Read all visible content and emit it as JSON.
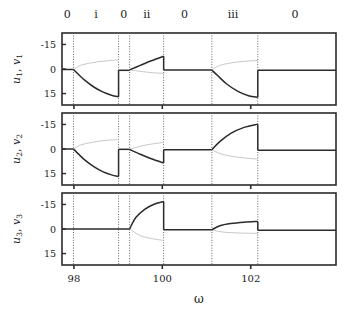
{
  "figure": {
    "xlabel": "ω",
    "x_ticks": [
      98,
      100,
      102
    ],
    "x_tick_labels": [
      "98",
      "100",
      "102"
    ],
    "y_ticks": [
      15,
      0,
      -15
    ],
    "y_tick_labels": [
      "15",
      "0",
      "-15"
    ],
    "xlim": [
      97.73,
      103.93
    ],
    "ylim": [
      -22,
      22
    ],
    "region_labels": [
      "0",
      "i",
      "0",
      "ii",
      "0",
      "iii",
      "0"
    ],
    "region_label_x": [
      97.85,
      98.5,
      99.13,
      99.65,
      100.5,
      101.6,
      103.0
    ],
    "boundaries": [
      97.99,
      99.01,
      99.26,
      100.03,
      101.12,
      102.16
    ],
    "colors": {
      "stable_branch": "#2b2b2b",
      "unstable_branch": "#c8c8c8",
      "axis": "#2b2b2b",
      "boundary_line": "#555555",
      "background": "#ffffff"
    },
    "panels": [
      {
        "ylabel": "u₁, v₁",
        "ylabel_parts": {
          "u": "u",
          "usub": "1",
          "v": "v",
          "vsub": "1"
        }
      },
      {
        "ylabel": "u₂, v₂",
        "ylabel_parts": {
          "u": "u",
          "usub": "2",
          "v": "v",
          "vsub": "2"
        }
      },
      {
        "ylabel": "u₃, v₃",
        "ylabel_parts": {
          "u": "u",
          "usub": "3",
          "v": "v",
          "vsub": "3"
        }
      }
    ]
  },
  "chart_data": {
    "type": "line",
    "title": "",
    "xlabel": "ω",
    "ylabel": "u_i, v_i",
    "xlim": [
      97.73,
      103.93
    ],
    "ylim": [
      -22,
      22
    ],
    "grid": false,
    "legend": null,
    "annotations": [
      {
        "text": "0",
        "x": 97.85,
        "y": 23,
        "note": "region label above top axis"
      },
      {
        "text": "i",
        "x": 98.5,
        "y": 23,
        "note": "region label above top axis"
      },
      {
        "text": "0",
        "x": 99.13,
        "y": 23,
        "note": "region label above top axis"
      },
      {
        "text": "ii",
        "x": 99.65,
        "y": 23,
        "note": "region label above top axis"
      },
      {
        "text": "0",
        "x": 100.5,
        "y": 23,
        "note": "region label above top axis"
      },
      {
        "text": "iii",
        "x": 101.6,
        "y": 23,
        "note": "region label above top axis"
      },
      {
        "text": "0",
        "x": 103.0,
        "y": 23,
        "note": "region label above top axis"
      }
    ],
    "vertical_lines": [
      97.99,
      99.01,
      99.26,
      100.03,
      101.12,
      102.16
    ],
    "panels": [
      {
        "name": "u1_v1",
        "ylabel": "u₁, v₁",
        "yticks": [
          -15,
          0,
          15
        ],
        "series": [
          {
            "name": "u1-trivial-left",
            "style": "stable",
            "x": [
              97.73,
              97.99
            ],
            "y": [
              -0.3,
              -0.3
            ]
          },
          {
            "name": "u1-branch-i-lower",
            "style": "stable",
            "x": [
              97.99,
              98.1,
              98.25,
              98.45,
              98.65,
              98.85,
              99.01
            ],
            "y": [
              -0.3,
              -3.2,
              -7.0,
              -11.0,
              -14.0,
              -16.0,
              -17.0
            ]
          },
          {
            "name": "v1-branch-i-upper",
            "style": "unstable",
            "x": [
              97.99,
              98.15,
              98.4,
              98.7,
              99.01
            ],
            "y": [
              -0.3,
              2.2,
              3.8,
              4.9,
              5.6
            ]
          },
          {
            "name": "u1-branch-0b",
            "style": "stable",
            "x": [
              99.01,
              99.26
            ],
            "y": [
              -0.8,
              -0.8
            ]
          },
          {
            "name": "u1-branch-ii-upper",
            "style": "stable",
            "x": [
              99.26,
              99.5,
              99.75,
              100.03
            ],
            "y": [
              -0.5,
              2.2,
              5.0,
              7.8
            ]
          },
          {
            "name": "v1-branch-ii-lower",
            "style": "unstable",
            "x": [
              99.26,
              99.55,
              99.8,
              100.03
            ],
            "y": [
              -0.5,
              -1.6,
              -2.3,
              -2.7
            ]
          },
          {
            "name": "u1-branch-0c",
            "style": "stable",
            "x": [
              100.03,
              101.12
            ],
            "y": [
              -0.6,
              -0.6
            ]
          },
          {
            "name": "u1-branch-iii-lower",
            "style": "stable",
            "x": [
              101.12,
              101.25,
              101.45,
              101.7,
              101.95,
              102.16
            ],
            "y": [
              -0.6,
              -4.0,
              -9.0,
              -13.5,
              -16.3,
              -17.3
            ]
          },
          {
            "name": "v1-branch-iii-upper",
            "style": "unstable",
            "x": [
              101.12,
              101.3,
              101.6,
              101.9,
              102.16
            ],
            "y": [
              -0.6,
              2.2,
              3.9,
              4.8,
              5.3
            ]
          },
          {
            "name": "u1-trivial-right",
            "style": "stable",
            "x": [
              102.16,
              103.93
            ],
            "y": [
              -0.8,
              -0.8
            ]
          }
        ]
      },
      {
        "name": "u2_v2",
        "ylabel": "u₂, v₂",
        "yticks": [
          -15,
          0,
          15
        ],
        "series": [
          {
            "name": "u2-trivial-left",
            "style": "stable",
            "x": [
              97.73,
              97.99
            ],
            "y": [
              0.0,
              0.0
            ]
          },
          {
            "name": "u2-branch-i-lower",
            "style": "stable",
            "x": [
              97.99,
              98.1,
              98.25,
              98.45,
              98.65,
              98.85,
              99.01
            ],
            "y": [
              0.0,
              -3.0,
              -6.8,
              -10.8,
              -13.8,
              -15.8,
              -16.8
            ]
          },
          {
            "name": "v2-branch-i-upper",
            "style": "unstable",
            "x": [
              97.99,
              98.15,
              98.4,
              98.7,
              99.01
            ],
            "y": [
              0.0,
              2.4,
              4.0,
              5.2,
              5.8
            ]
          },
          {
            "name": "u2-branch-0b",
            "style": "stable",
            "x": [
              99.01,
              99.26
            ],
            "y": [
              -0.2,
              -0.2
            ]
          },
          {
            "name": "u2-branch-ii-lower",
            "style": "stable",
            "x": [
              99.26,
              99.5,
              99.75,
              100.03
            ],
            "y": [
              -0.3,
              -3.2,
              -6.0,
              -8.5
            ]
          },
          {
            "name": "v2-branch-ii-upper",
            "style": "unstable",
            "x": [
              99.26,
              99.55,
              99.8,
              100.03
            ],
            "y": [
              -0.3,
              2.0,
              3.2,
              4.0
            ]
          },
          {
            "name": "u2-branch-0c",
            "style": "stable",
            "x": [
              100.03,
              101.12
            ],
            "y": [
              -0.5,
              -0.5
            ]
          },
          {
            "name": "u2-branch-iii-upper",
            "style": "stable",
            "x": [
              101.12,
              101.3,
              101.55,
              101.85,
              102.16
            ],
            "y": [
              -0.5,
              4.5,
              9.5,
              13.2,
              15.2
            ]
          },
          {
            "name": "v2-branch-iii-lower",
            "style": "unstable",
            "x": [
              101.12,
              101.35,
              101.7,
              102.16
            ],
            "y": [
              -0.5,
              -3.2,
              -5.0,
              -6.2
            ]
          },
          {
            "name": "u2-trivial-right",
            "style": "stable",
            "x": [
              102.16,
              103.93
            ],
            "y": [
              -0.7,
              -0.7
            ]
          }
        ]
      },
      {
        "name": "u3_v3",
        "ylabel": "u₃, v₃",
        "yticks": [
          -15,
          0,
          15
        ],
        "series": [
          {
            "name": "u3-trivial-left",
            "style": "stable",
            "x": [
              97.73,
              99.26
            ],
            "y": [
              0.0,
              0.0
            ]
          },
          {
            "name": "u3-branch-ii-upper",
            "style": "stable",
            "x": [
              99.26,
              99.4,
              99.6,
              99.8,
              100.03
            ],
            "y": [
              0.0,
              7.0,
              12.0,
              15.0,
              16.8
            ]
          },
          {
            "name": "v3-branch-ii-lower",
            "style": "unstable",
            "x": [
              99.26,
              99.5,
              99.75,
              100.03
            ],
            "y": [
              0.0,
              -4.0,
              -5.8,
              -7.0
            ]
          },
          {
            "name": "u3-branch-0c",
            "style": "stable",
            "x": [
              100.03,
              101.12
            ],
            "y": [
              -0.5,
              -0.5
            ]
          },
          {
            "name": "u3-branch-iii-upper",
            "style": "stable",
            "x": [
              101.12,
              101.3,
              101.55,
              101.85,
              102.16
            ],
            "y": [
              -0.5,
              2.0,
              3.4,
              4.2,
              4.6
            ]
          },
          {
            "name": "v3-branch-iii-lower",
            "style": "unstable",
            "x": [
              101.12,
              101.35,
              101.7,
              102.16
            ],
            "y": [
              -0.5,
              -1.8,
              -2.4,
              -2.7
            ]
          },
          {
            "name": "u3-trivial-right",
            "style": "stable",
            "x": [
              102.16,
              103.93
            ],
            "y": [
              -0.8,
              -0.8
            ]
          }
        ]
      }
    ]
  }
}
